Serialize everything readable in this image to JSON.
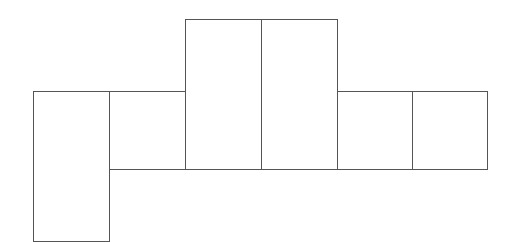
{
  "diagram": {
    "type": "net-of-rectangular-prism",
    "stroke_color": "#555555",
    "fill_color": "#ffffff",
    "background": "#ffffff",
    "faces": [
      {
        "id": "face-1",
        "x": 33,
        "y": 91,
        "w": 77,
        "h": 151
      },
      {
        "id": "face-2",
        "x": 109,
        "y": 91,
        "w": 77,
        "h": 79
      },
      {
        "id": "face-3",
        "x": 185,
        "y": 19,
        "w": 77,
        "h": 151
      },
      {
        "id": "face-4",
        "x": 261,
        "y": 19,
        "w": 77,
        "h": 151
      },
      {
        "id": "face-5",
        "x": 337,
        "y": 91,
        "w": 76,
        "h": 79
      },
      {
        "id": "face-6",
        "x": 412,
        "y": 91,
        "w": 76,
        "h": 79
      }
    ]
  }
}
